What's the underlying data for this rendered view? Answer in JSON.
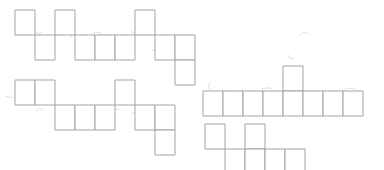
{
  "figure": {
    "background_color": "#ffffff",
    "line_color": "#9a9a9a",
    "smudge_color": "#c9c9c9",
    "canvas": {
      "width": 384,
      "height": 170
    },
    "cell_size": {
      "width": 20,
      "height": 25
    }
  },
  "shapes": [
    {
      "id": "shape-top-left",
      "name": "top-left-net",
      "label": "Top-left polyomino net",
      "origin": {
        "x": 15,
        "y": 10
      },
      "cell_count": 10,
      "cells": [
        {
          "col": 0,
          "row": 0
        },
        {
          "col": 1,
          "row": 1
        },
        {
          "col": 2,
          "row": 0
        },
        {
          "col": 3,
          "row": 1
        },
        {
          "col": 4,
          "row": 1
        },
        {
          "col": 5,
          "row": 1
        },
        {
          "col": 6,
          "row": 0
        },
        {
          "col": 7,
          "row": 1
        },
        {
          "col": 8,
          "row": 1
        },
        {
          "col": 8,
          "row": 2
        }
      ]
    },
    {
      "id": "shape-bottom-left",
      "name": "bottom-left-net",
      "label": "Bottom-left polyomino net",
      "origin": {
        "x": 15,
        "y": 80
      },
      "cell_count": 10,
      "cells": [
        {
          "col": 0,
          "row": 0
        },
        {
          "col": 1,
          "row": 0
        },
        {
          "col": 2,
          "row": 1
        },
        {
          "col": 3,
          "row": 1
        },
        {
          "col": 4,
          "row": 1
        },
        {
          "col": 5,
          "row": 0
        },
        {
          "col": 6,
          "row": 1
        },
        {
          "col": 7,
          "row": 1
        },
        {
          "col": 7,
          "row": 2
        }
      ]
    },
    {
      "id": "shape-middle-right",
      "name": "middle-right-net",
      "label": "Middle-right polyomino net",
      "origin": {
        "x": 203,
        "y": 66
      },
      "cell_count": 9,
      "cells": [
        {
          "col": 0,
          "row": 1
        },
        {
          "col": 1,
          "row": 1
        },
        {
          "col": 2,
          "row": 1
        },
        {
          "col": 3,
          "row": 1
        },
        {
          "col": 4,
          "row": 0
        },
        {
          "col": 4,
          "row": 1
        },
        {
          "col": 5,
          "row": 1
        },
        {
          "col": 6,
          "row": 1
        },
        {
          "col": 7,
          "row": 1
        }
      ]
    },
    {
      "id": "shape-bottom-right",
      "name": "bottom-right-net",
      "label": "Bottom-right polyomino net",
      "origin": {
        "x": 205,
        "y": 124
      },
      "cell_count": 6,
      "cells": [
        {
          "col": 0,
          "row": 0
        },
        {
          "col": 1,
          "row": 1
        },
        {
          "col": 2,
          "row": 0
        },
        {
          "col": 2,
          "row": 1
        },
        {
          "col": 3,
          "row": 1
        },
        {
          "col": 4,
          "row": 1
        }
      ]
    }
  ],
  "pencil_marks": [
    {
      "name": "mark-top-left-a",
      "path": "M 22 33 q 5 -3 9 1"
    },
    {
      "name": "mark-top-left-b",
      "path": "M 34 31 q 4 5 8 1"
    },
    {
      "name": "mark-top-left-c",
      "path": "M 56 36 q 4 -5 7 -1"
    },
    {
      "name": "mark-top-left-d",
      "path": "M 74 33 q -5 2 -2 5"
    },
    {
      "name": "mark-top-left-e",
      "path": "M 92 34 q 6 -4 10 0"
    },
    {
      "name": "mark-top-left-f",
      "path": "M 131 30 q 2 5 6 2"
    },
    {
      "name": "mark-top-left-g",
      "path": "M 152 50 q 7 -1 11 2"
    },
    {
      "name": "mark-top-left-h",
      "path": "M 178 44 q 4 -2 6 1"
    },
    {
      "name": "mark-bottom-left-a",
      "path": "M 6 96 q 8 3 14 0"
    },
    {
      "name": "mark-bottom-left-b",
      "path": "M 36 87 l 1 12"
    },
    {
      "name": "mark-bottom-left-c",
      "path": "M 36 112 q 4 -6 7 -2"
    },
    {
      "name": "mark-bottom-left-d",
      "path": "M 56 112 q 5 5 9 -1"
    },
    {
      "name": "mark-bottom-left-e",
      "path": "M 72 110 l 2 10"
    },
    {
      "name": "mark-bottom-left-f",
      "path": "M 95 112 q 8 5 14 2"
    },
    {
      "name": "mark-bottom-left-g",
      "path": "M 113 106 q 3 6 6 3"
    },
    {
      "name": "mark-bottom-left-h",
      "path": "M 132 114 q 4 -4 7 0"
    },
    {
      "name": "mark-bottom-left-i",
      "path": "M 148 128 q 5 4 9 1"
    },
    {
      "name": "mark-middle-right-a",
      "path": "M 211 82 q -5 3 -1 8"
    },
    {
      "name": "mark-middle-right-b",
      "path": "M 233 90 q 5 4 9 0"
    },
    {
      "name": "mark-middle-right-c",
      "path": "M 262 89 q 7 -3 11 1"
    },
    {
      "name": "mark-middle-right-d",
      "path": "M 284 74 l 1 9"
    },
    {
      "name": "mark-middle-right-e",
      "path": "M 307 92 q 5 -2 8 1"
    },
    {
      "name": "mark-middle-right-f",
      "path": "M 325 94 q 5 -3 8 0"
    },
    {
      "name": "mark-middle-right-g",
      "path": "M 344 90 q 7 -4 12 0"
    },
    {
      "name": "mark-middle-right-h",
      "path": "M 300 35 q 4 -5 8 -1"
    },
    {
      "name": "mark-middle-right-i",
      "path": "M 288 55 q 3 6 6 3"
    },
    {
      "name": "mark-bottom-right-a",
      "path": "M 213 132 l 1 10"
    },
    {
      "name": "mark-bottom-right-b",
      "path": "M 229 158 q 6 3 10 0"
    },
    {
      "name": "mark-bottom-right-c",
      "path": "M 250 148 q 4 6 8 2"
    },
    {
      "name": "mark-bottom-right-d",
      "path": "M 266 154 q -5 3 -1 6"
    },
    {
      "name": "mark-bottom-right-e",
      "path": "M 283 152 q 7 -3 11 1"
    }
  ]
}
